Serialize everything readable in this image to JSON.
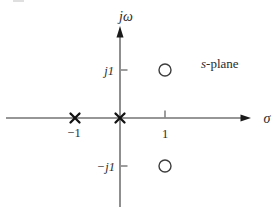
{
  "figure": {
    "type": "pole-zero-plot",
    "background_color": "#ffffff",
    "axis_color": "#737373",
    "pole_color": "#111111",
    "zero_color": "#3d3d3d",
    "text_color": "#2b2b2b",
    "labels": {
      "vertical_axis": "jω",
      "horizontal_axis": "σ",
      "plane_s": "s",
      "plane_rest": "-plane",
      "tick_pos_imag": "j1",
      "tick_neg_imag": "−j1",
      "tick_neg_real": "−1",
      "tick_pos_real": "1"
    },
    "poles": [
      {
        "sigma": -1,
        "jomega": 0
      },
      {
        "sigma": 0,
        "jomega": 0
      }
    ],
    "zeros": [
      {
        "sigma": 1,
        "jomega": 1
      },
      {
        "sigma": 1,
        "jomega": -1
      }
    ]
  }
}
